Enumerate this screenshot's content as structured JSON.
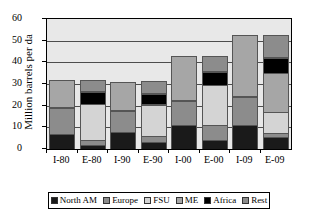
{
  "chart_data": {
    "type": "bar",
    "subtype": "stacked-column",
    "title": "",
    "xlabel": "",
    "ylabel": "Million barrels per da",
    "ylim": [
      0,
      60
    ],
    "yticks": [
      0,
      10,
      20,
      30,
      40,
      50,
      60
    ],
    "grid": true,
    "legend_position": "bottom",
    "categories": [
      "I-80",
      "E-80",
      "I-90",
      "E-90",
      "I-00",
      "E-00",
      "I-09",
      "E-09"
    ],
    "series": [
      {
        "name": "North AM",
        "color": "#1a1a1a",
        "values": [
          7.0,
          2.0,
          8.0,
          3.3,
          11.0,
          4.0,
          11.0,
          5.5
        ]
      },
      {
        "name": "Europe",
        "color": "#8c8c8c",
        "values": [
          12.0,
          2.0,
          9.5,
          2.7,
          11.0,
          7.0,
          13.0,
          2.0
        ]
      },
      {
        "name": "FSU",
        "color": "#d4d4d4",
        "values": [
          0.0,
          17.0,
          0.0,
          14.5,
          0.0,
          18.5,
          0.0,
          9.5
        ]
      },
      {
        "name": "ME",
        "color": "#a6a6a6",
        "values": [
          13.0,
          0.0,
          13.5,
          0.5,
          21.0,
          0.0,
          28.5,
          18.0
        ]
      },
      {
        "name": "Africa",
        "color": "#000000",
        "values": [
          0.0,
          5.5,
          0.0,
          4.5,
          0.0,
          6.0,
          0.0,
          7.0
        ]
      },
      {
        "name": "Rest",
        "color": "#8c8c8c",
        "values": [
          0.0,
          5.5,
          0.0,
          6.0,
          0.0,
          7.5,
          0.0,
          10.5
        ]
      }
    ],
    "totals": [
      32.0,
      32.0,
      31.0,
      31.5,
      43.0,
      43.0,
      52.5,
      52.5
    ]
  },
  "legend": {
    "items": [
      {
        "label": "North AM",
        "color": "#1a1a1a"
      },
      {
        "label": "Europe",
        "color": "#8c8c8c"
      },
      {
        "label": "FSU",
        "color": "#d4d4d4"
      },
      {
        "label": "ME",
        "color": "#a6a6a6"
      },
      {
        "label": "Africa",
        "color": "#000000"
      },
      {
        "label": "Rest",
        "color": "#8c8c8c"
      }
    ]
  },
  "axis": {
    "y_title": "Million barrels per da",
    "y_tick_labels": [
      "60",
      "50",
      "40",
      "30",
      "20",
      "10",
      "0"
    ],
    "x_tick_labels": [
      "I-80",
      "E-80",
      "I-90",
      "E-90",
      "I-00",
      "E-00",
      "I-09",
      "E-09"
    ]
  },
  "colors": {
    "plot_background": "#e8e8e8",
    "axis_line": "#000000",
    "gridline": "#4d4d4d"
  }
}
